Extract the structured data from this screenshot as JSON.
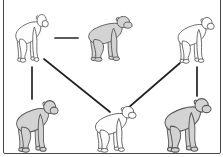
{
  "figure": {
    "kind": "node-link-diagram"
  },
  "colors": {
    "background": "#ffffff",
    "frame_border": "#4a4a4a",
    "edge_line": "#242424",
    "shaded_fill": "#d3d3d3",
    "unshaded_fill": "#fdfdfd",
    "outline": "#5a5a5a"
  },
  "diagram": {
    "nodes": [
      {
        "id": "chimp-top-left",
        "shade": "unshaded",
        "x": 13,
        "y": 13,
        "w": 36,
        "h": 50
      },
      {
        "id": "chimp-top-center",
        "shade": "shaded",
        "x": 85,
        "y": 15,
        "w": 48,
        "h": 47
      },
      {
        "id": "chimp-top-right",
        "shade": "unshaded",
        "x": 175,
        "y": 16,
        "w": 40,
        "h": 48
      },
      {
        "id": "chimp-bottom-left",
        "shade": "shaded",
        "x": 13,
        "y": 99,
        "w": 46,
        "h": 54
      },
      {
        "id": "chimp-bottom-center",
        "shade": "unshaded",
        "x": 92,
        "y": 105,
        "w": 45,
        "h": 48
      },
      {
        "id": "chimp-bottom-right",
        "shade": "shaded",
        "x": 161,
        "y": 97,
        "w": 51,
        "h": 56
      }
    ],
    "edges": [
      {
        "id": "edge-topleft-topcenter",
        "from": "chimp-top-left",
        "to": "chimp-top-center",
        "x1": 55,
        "y1": 38,
        "x2": 78,
        "y2": 38
      },
      {
        "id": "edge-topleft-bottomleft",
        "from": "chimp-top-left",
        "to": "chimp-bottom-left",
        "x1": 32,
        "y1": 67,
        "x2": 32,
        "y2": 99
      },
      {
        "id": "edge-topleft-bottomcenter",
        "from": "chimp-top-left",
        "to": "chimp-bottom-center",
        "x1": 44,
        "y1": 59,
        "x2": 110,
        "y2": 112
      },
      {
        "id": "edge-topright-bottomcenter",
        "from": "chimp-top-right",
        "to": "chimp-bottom-center",
        "x1": 180,
        "y1": 63,
        "x2": 128,
        "y2": 108
      },
      {
        "id": "edge-topright-bottomright",
        "from": "chimp-top-right",
        "to": "chimp-bottom-right",
        "x1": 197,
        "y1": 67,
        "x2": 197,
        "y2": 96
      }
    ],
    "edge_stroke_width": 1.7
  }
}
